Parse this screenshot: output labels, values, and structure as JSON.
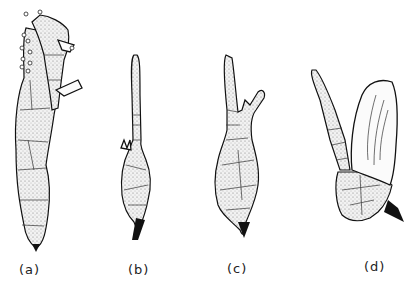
{
  "figure": {
    "type": "botanical line illustration",
    "panels": [
      {
        "id": "a",
        "label": "(a)",
        "description": "two elongated branched structures with granular cells, small round bodies at tips"
      },
      {
        "id": "b",
        "label": "(b)",
        "description": "swollen base with long single filament of cells"
      },
      {
        "id": "c",
        "label": "(c)",
        "description": "swollen base with two branching filaments"
      },
      {
        "id": "d",
        "label": "(d)",
        "description": "base with filament and sheath-like leaf enclosing narrow segments"
      }
    ],
    "colors": {
      "ink": "#111111",
      "background": "#ffffff"
    }
  }
}
